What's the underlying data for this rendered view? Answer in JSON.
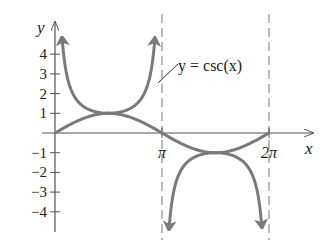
{
  "chart_data": {
    "type": "line",
    "title": "",
    "xlabel": "x",
    "ylabel": "y",
    "annotation": "y = csc(x)",
    "xticks": [
      {
        "value": 3.14159,
        "label": "π"
      },
      {
        "value": 6.28319,
        "label": "2π"
      }
    ],
    "yticks": [
      {
        "value": 4,
        "label": "4"
      },
      {
        "value": 3,
        "label": "3"
      },
      {
        "value": 2,
        "label": "2"
      },
      {
        "value": 1,
        "label": "1"
      },
      {
        "value": -1,
        "label": "−1"
      },
      {
        "value": -2,
        "label": "−2"
      },
      {
        "value": -3,
        "label": "−3"
      },
      {
        "value": -4,
        "label": "−4"
      }
    ],
    "xlim": [
      0,
      7.0
    ],
    "ylim": [
      -5,
      5
    ],
    "grid": false,
    "asymptotes": [
      3.14159,
      6.28319
    ],
    "series": [
      {
        "name": "csc(x)",
        "function": "1/sin(x)",
        "ranges": [
          [
            0.22,
            2.92
          ],
          [
            3.36,
            6.06
          ]
        ],
        "style": "solid-with-arrows"
      },
      {
        "name": "sin(x)",
        "function": "sin(x)",
        "ranges": [
          [
            0,
            6.28319
          ]
        ],
        "style": "solid"
      }
    ],
    "color": "#7a7a7a"
  }
}
